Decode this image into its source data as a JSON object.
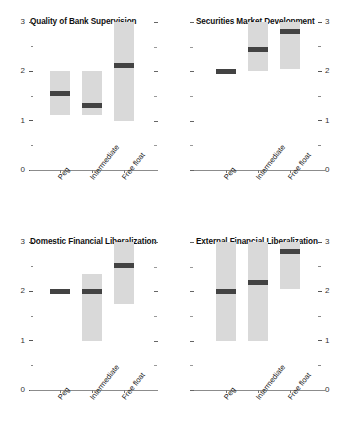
{
  "figure": {
    "categories": [
      "Peg",
      "Intermediate",
      "Free float"
    ],
    "y_axis": {
      "min": 0,
      "max": 3,
      "major_ticks": [
        "0",
        "1",
        "2",
        "3"
      ],
      "minor_ticks": [
        "0.5",
        "1.5",
        "2.5"
      ]
    },
    "colors": {
      "box": "#d9d9d9",
      "median": "#434343",
      "axis": "#8c8c8c",
      "text": "#111111"
    }
  },
  "chart_data": [
    {
      "type": "bar",
      "title": "Quality of Bank Supervision",
      "xlabel": "",
      "ylabel": "",
      "ylim": [
        0,
        3
      ],
      "grid": false,
      "legend": "none",
      "categories": [
        "Peg",
        "Intermediate",
        "Free float"
      ],
      "series": [
        {
          "name": "range_low",
          "values": [
            1.12,
            1.12,
            1.0
          ]
        },
        {
          "name": "range_high",
          "values": [
            2.0,
            2.0,
            3.0
          ]
        },
        {
          "name": "median",
          "values": [
            1.55,
            1.3,
            2.12
          ]
        }
      ]
    },
    {
      "type": "bar",
      "title": "Securities Market Development",
      "xlabel": "",
      "ylabel": "",
      "ylim": [
        0,
        3
      ],
      "grid": false,
      "legend": "none",
      "categories": [
        "Peg",
        "Intermediate",
        "Free float"
      ],
      "series": [
        {
          "name": "range_low",
          "values": [
            2.0,
            2.0,
            2.05
          ]
        },
        {
          "name": "range_high",
          "values": [
            2.0,
            3.0,
            3.0
          ]
        },
        {
          "name": "median",
          "values": [
            2.0,
            2.45,
            2.8
          ]
        }
      ]
    },
    {
      "type": "bar",
      "title": "Domestic Financial Liberalization",
      "xlabel": "",
      "ylabel": "",
      "ylim": [
        0,
        3
      ],
      "grid": false,
      "legend": "none",
      "categories": [
        "Peg",
        "Intermediate",
        "Free float"
      ],
      "series": [
        {
          "name": "range_low",
          "values": [
            2.0,
            1.0,
            1.75
          ]
        },
        {
          "name": "range_high",
          "values": [
            2.0,
            2.35,
            3.0
          ]
        },
        {
          "name": "median",
          "values": [
            2.0,
            2.0,
            2.52
          ]
        }
      ]
    },
    {
      "type": "bar",
      "title": "External Financial Liberalization",
      "xlabel": "",
      "ylabel": "",
      "ylim": [
        0,
        3
      ],
      "grid": false,
      "legend": "none",
      "categories": [
        "Peg",
        "Intermediate",
        "Free float"
      ],
      "series": [
        {
          "name": "range_low",
          "values": [
            1.0,
            1.0,
            2.05
          ]
        },
        {
          "name": "range_high",
          "values": [
            3.0,
            3.0,
            3.0
          ]
        },
        {
          "name": "median",
          "values": [
            2.0,
            2.18,
            2.8
          ]
        }
      ]
    }
  ]
}
